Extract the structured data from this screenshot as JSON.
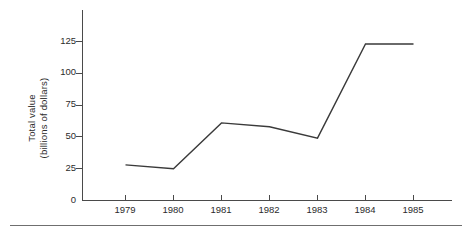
{
  "chart_data": {
    "type": "line",
    "title": "",
    "subtitle": "",
    "xlabel": "",
    "ylabel": "Total value\n(billions of dollars)",
    "ylabel_line1": "Total value",
    "ylabel_line2": "(billions of dollars)",
    "categories": [
      "1979",
      "1980",
      "1981",
      "1982",
      "1983",
      "1984",
      "1985"
    ],
    "x": [
      1979,
      1980,
      1981,
      1982,
      1983,
      1984,
      1985
    ],
    "values": [
      28,
      25,
      61,
      58,
      49,
      123,
      123
    ],
    "series": [
      {
        "name": "Total value",
        "values": [
          28,
          25,
          61,
          58,
          49,
          123,
          123
        ]
      }
    ],
    "ylim": [
      0,
      132
    ],
    "xlim": [
      1978.5,
      1985.7
    ],
    "yticks": [
      0,
      25,
      50,
      75,
      100,
      125
    ],
    "ytick_labels": [
      "0",
      "25",
      "50",
      "75",
      "100",
      "125"
    ],
    "xticks": [
      1979,
      1980,
      1981,
      1982,
      1983,
      1984,
      1985
    ],
    "xtick_labels": [
      "1979",
      "1980",
      "1981",
      "1982",
      "1983",
      "1984",
      "1985"
    ],
    "grid": false,
    "legend": false,
    "legend_position": "none",
    "annotations": [],
    "line_color": "#3a3a3a",
    "axis_color": "#4a4a4a",
    "background_color": "#ffffff"
  },
  "figure": {
    "bottom_rule": ""
  }
}
